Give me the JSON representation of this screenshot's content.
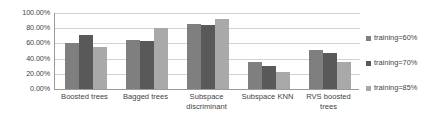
{
  "chart_data": {
    "type": "bar",
    "title": "",
    "xlabel": "",
    "ylabel": "",
    "ylim": [
      0,
      100
    ],
    "ytick_labels": [
      "100.00%",
      "80.00%",
      "60.00%",
      "40.00%",
      "20.00%",
      "0.00%"
    ],
    "ytick_values": [
      100,
      80,
      60,
      40,
      20,
      0
    ],
    "grid": true,
    "legend_position": "right",
    "categories": [
      "Boosted trees",
      "Bagged trees",
      "Subspace discriminant",
      "Subspace KNN",
      "RVS boosted trees"
    ],
    "series": [
      {
        "name": "training=60%",
        "color": "#7f7f7f",
        "values": [
          60,
          65,
          85,
          36,
          51
        ]
      },
      {
        "name": "training=70%",
        "color": "#595959",
        "values": [
          71,
          63,
          84,
          30,
          47
        ]
      },
      {
        "name": "training=85%",
        "color": "#a9a9a9",
        "values": [
          55,
          80,
          92,
          23,
          36
        ]
      }
    ]
  },
  "legend": {
    "items": [
      {
        "label": "training=60%"
      },
      {
        "label": "training=70%"
      },
      {
        "label": "training=85%"
      }
    ]
  }
}
